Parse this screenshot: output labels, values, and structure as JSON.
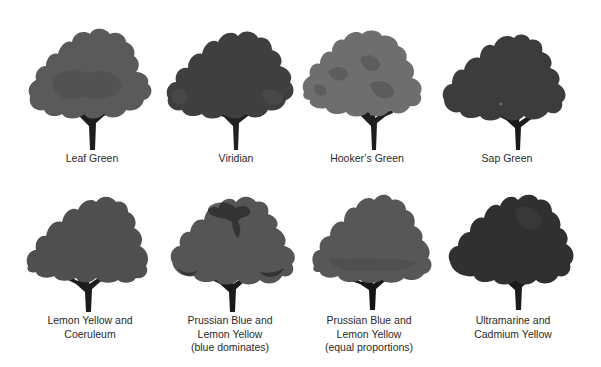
{
  "figure": {
    "rows": [
      {
        "trees": [
          {
            "id": "leaf-green",
            "lines": [
              "Leaf Green"
            ],
            "canopy": "#5a5a5a",
            "shade": "#4a4a4a",
            "trunk": "#1e1e1e"
          },
          {
            "id": "viridian",
            "lines": [
              "Viridian"
            ],
            "canopy": "#3f3f3f",
            "shade": "#333333",
            "trunk": "#222222"
          },
          {
            "id": "hookers-green",
            "lines": [
              "Hooker’s Green"
            ],
            "canopy": "#6e6e6e",
            "shade": "#555555",
            "trunk": "#1e1e1e"
          },
          {
            "id": "sap-green",
            "lines": [
              "Sap Green"
            ],
            "canopy": "#3c3c3c",
            "shade": "#333333",
            "trunk": "#1a1a1a"
          }
        ]
      },
      {
        "trees": [
          {
            "id": "lemon-yellow-coeruleum",
            "lines": [
              "Lemon Yellow and",
              "Coeruleum"
            ],
            "canopy": "#4f4f4f",
            "shade": "#474747",
            "trunk": "#1c1c1c"
          },
          {
            "id": "prussian-blue-lemon-yellow-blue",
            "lines": [
              "Prussian Blue and",
              "Lemon Yellow",
              "(blue dominates)"
            ],
            "canopy": "#555555",
            "shade": "#2a2a2a",
            "trunk": "#1a1a1a"
          },
          {
            "id": "prussian-blue-lemon-yellow-equal",
            "lines": [
              "Prussian Blue and",
              "Lemon Yellow",
              "(equal proportions)"
            ],
            "canopy": "#575757",
            "shade": "#4b4b4b",
            "trunk": "#151515"
          },
          {
            "id": "ultramarine-cadmium-yellow",
            "lines": [
              "Ultramarine and",
              "Cadmium Yellow"
            ],
            "canopy": "#303030",
            "shade": "#262626",
            "trunk": "#1c1c1c"
          }
        ]
      }
    ]
  }
}
